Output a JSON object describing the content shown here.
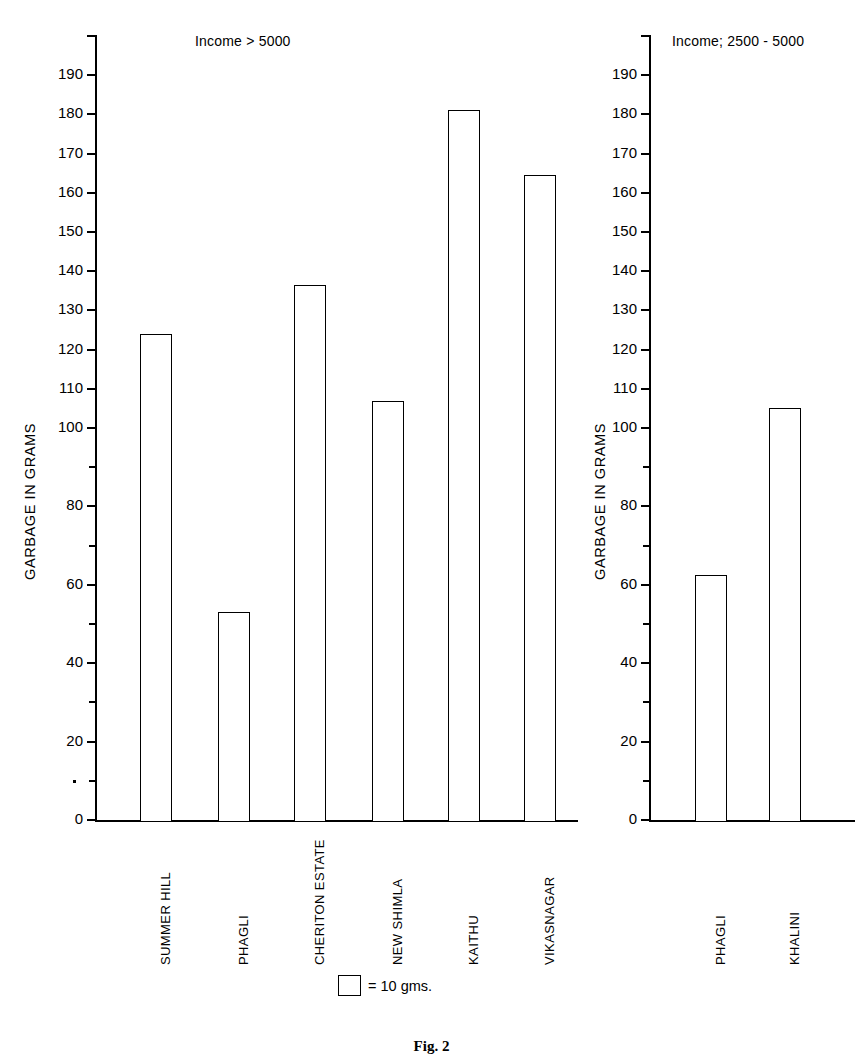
{
  "figure": {
    "caption": "Fig. 2"
  },
  "legend": {
    "swatch_name": "square-swatch",
    "text": "= 10 gms."
  },
  "axis": {
    "ylabel": "GARBAGE IN GRAMS",
    "ymin": 0,
    "ymax": 200,
    "major_step": 20,
    "minor_step": 10,
    "tick_labels": [
      "0",
      "20",
      "40",
      "60",
      "80",
      "100",
      "110",
      "120",
      "130",
      "140",
      "150",
      "160",
      "170",
      "180",
      "190"
    ],
    "missing_label_value": 90
  },
  "chart_data": [
    {
      "type": "bar",
      "title": "Income > 5000",
      "categories": [
        "SUMMER HILL",
        "PHAGLI",
        "CHERITON ESTATE",
        "NEW SHIMLA",
        "KAITHU",
        "VIKASNAGAR"
      ],
      "values": [
        124,
        53,
        136.5,
        107,
        181,
        164.5
      ],
      "xlabel": "",
      "ylabel": "GARBAGE IN GRAMS",
      "ylim": [
        0,
        200
      ],
      "yticks": [
        0,
        20,
        40,
        60,
        80,
        100,
        110,
        120,
        130,
        140,
        150,
        160,
        170,
        180,
        190
      ],
      "minor_ticks": [
        10,
        30,
        50,
        70,
        90,
        105,
        115,
        125,
        135,
        145,
        155,
        165,
        175,
        185,
        195
      ],
      "grid": false,
      "legend": "= 10 gms.",
      "legend_position": "bottom-center",
      "bar_style": "hollow-outline"
    },
    {
      "type": "bar",
      "title": "Income; 2500 - 5000",
      "categories": [
        "PHAGLI",
        "KHALINI"
      ],
      "values": [
        62.5,
        105
      ],
      "xlabel": "",
      "ylabel": "GARBAGE IN GRAMS",
      "ylim": [
        0,
        200
      ],
      "yticks": [
        0,
        20,
        40,
        60,
        80,
        100,
        110,
        120,
        130,
        140,
        150,
        160,
        170,
        180,
        190
      ],
      "minor_ticks": [
        10,
        30,
        50,
        70,
        90,
        105,
        115,
        125,
        135,
        145,
        155,
        165,
        175,
        185,
        195
      ],
      "grid": false,
      "bar_style": "hollow-outline"
    }
  ],
  "panels": [
    {
      "name": "left-panel",
      "title": "Income > 5000",
      "title_x": 195,
      "title_y": 33,
      "ylabel_x": 22,
      "ylabel_y": 580,
      "axis_x": 95,
      "axis_top": 36,
      "axis_bottom": 820,
      "axis_right": 578,
      "bars": [
        {
          "label": "SUMMER HILL",
          "value": 124,
          "x": 140,
          "w": 32,
          "label_x": 158,
          "label_y": 965
        },
        {
          "label": "PHAGLI",
          "value": 53,
          "x": 218,
          "w": 32,
          "label_x": 236,
          "label_y": 965
        },
        {
          "label": "CHERITON ESTATE",
          "value": 136.5,
          "x": 294,
          "w": 32,
          "label_x": 312,
          "label_y": 965
        },
        {
          "label": "NEW SHIMLA",
          "value": 107,
          "x": 372,
          "w": 32,
          "label_x": 390,
          "label_y": 965
        },
        {
          "label": "KAITHU",
          "value": 181,
          "x": 448,
          "w": 32,
          "label_x": 466,
          "label_y": 965
        },
        {
          "label": "VIKASNAGAR",
          "value": 164.5,
          "x": 524,
          "w": 32,
          "label_x": 542,
          "label_y": 965
        }
      ]
    },
    {
      "name": "right-panel",
      "title": "Income; 2500 - 5000",
      "title_x": 672,
      "title_y": 33,
      "ylabel_x": 592,
      "ylabel_y": 580,
      "axis_x": 649,
      "axis_top": 36,
      "axis_bottom": 820,
      "axis_right": 855,
      "bars": [
        {
          "label": "PHAGLI",
          "value": 62.5,
          "x": 695,
          "w": 32,
          "label_x": 713,
          "label_y": 965
        },
        {
          "label": "KHALINI",
          "value": 105,
          "x": 769,
          "w": 32,
          "label_x": 787,
          "label_y": 965
        }
      ]
    }
  ]
}
